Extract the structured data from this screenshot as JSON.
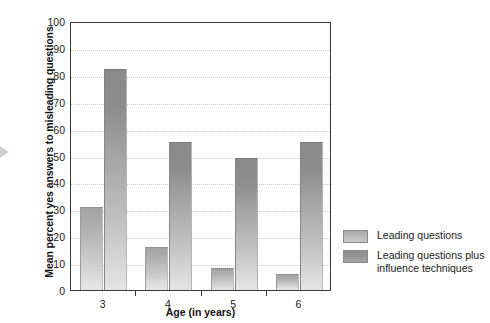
{
  "chart_data": {
    "type": "bar",
    "title": "",
    "xlabel": "Age (in years)",
    "ylabel": "Mean percent yes answers to misleading questions",
    "categories": [
      "3",
      "4",
      "5",
      "6"
    ],
    "ylim": [
      0,
      100
    ],
    "ytick_labels": [
      "0",
      "10",
      "20",
      "30",
      "40",
      "50",
      "60",
      "70",
      "80",
      "90",
      "100"
    ],
    "ytick_values": [
      0,
      10,
      20,
      30,
      40,
      50,
      60,
      70,
      80,
      90,
      100
    ],
    "grid": true,
    "legend_position": "right",
    "series": [
      {
        "name": "Leading questions",
        "color": "#b8b8b8",
        "values": [
          31,
          16,
          8,
          6
        ]
      },
      {
        "name": "Leading questions plus\ninfluence techniques",
        "color": "#8e8e8e",
        "values": [
          82,
          55,
          49,
          55
        ]
      }
    ]
  },
  "axes": {
    "y_title": "Mean percent yes answers to misleading questions",
    "x_title": "Age (in years)"
  },
  "legend": {
    "items": [
      {
        "label": "Leading questions",
        "swatch": "light"
      },
      {
        "label": "Leading questions plus\ninfluence techniques",
        "swatch": "dark"
      }
    ]
  },
  "colors": {
    "axis": "#3a3a3a",
    "grid": "#c9c9c9",
    "series_light": "#b8b8b8",
    "series_dark": "#8e8e8e",
    "text": "#1a1a1a"
  }
}
